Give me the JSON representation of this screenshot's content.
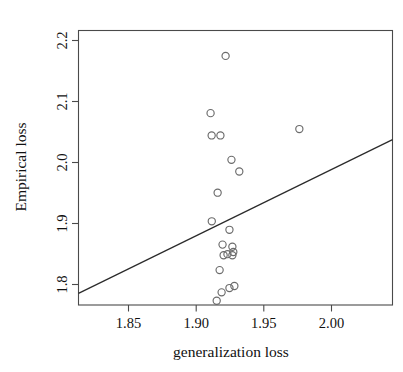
{
  "chart_data": {
    "type": "scatter",
    "title": "",
    "xlabel": "generalization loss",
    "ylabel": "Empirical loss",
    "xlim": [
      1.8095,
      2.0458
    ],
    "ylim": [
      1.7935,
      2.218
    ],
    "xticks": [
      1.85,
      1.9,
      1.95,
      2.0
    ],
    "xtick_labels": [
      "1.85",
      "1.90",
      "1.95",
      "2.00"
    ],
    "yticks": [
      1.8,
      1.9,
      2.0,
      2.1,
      2.2
    ],
    "ytick_labels": [
      "1.8",
      "1.9",
      "2.0",
      "2.1",
      "2.2"
    ],
    "grid": false,
    "legend": null,
    "marker": "open-circle",
    "marker_color": "#6b6b6b",
    "points": [
      {
        "x": 1.9202,
        "y": 2.1787
      },
      {
        "x": 1.9089,
        "y": 2.0902
      },
      {
        "x": 1.9097,
        "y": 2.0557
      },
      {
        "x": 1.9163,
        "y": 2.0557
      },
      {
        "x": 1.9757,
        "y": 2.0656
      },
      {
        "x": 1.9246,
        "y": 2.018
      },
      {
        "x": 1.9305,
        "y": 2.0
      },
      {
        "x": 1.9142,
        "y": 1.9672
      },
      {
        "x": 1.9098,
        "y": 1.9229
      },
      {
        "x": 1.9231,
        "y": 1.9098
      },
      {
        "x": 1.9179,
        "y": 1.8869
      },
      {
        "x": 1.9253,
        "y": 1.8836
      },
      {
        "x": 1.9187,
        "y": 1.8705
      },
      {
        "x": 1.9216,
        "y": 1.8721
      },
      {
        "x": 1.9253,
        "y": 1.8705
      },
      {
        "x": 1.926,
        "y": 1.8754
      },
      {
        "x": 1.9157,
        "y": 1.8475
      },
      {
        "x": 1.9231,
        "y": 1.8197
      },
      {
        "x": 1.9268,
        "y": 1.8229
      },
      {
        "x": 1.9172,
        "y": 1.8131
      },
      {
        "x": 1.9135,
        "y": 1.8
      }
    ],
    "fit_line": {
      "type": "linear-fit",
      "x0": 1.8095,
      "y0": 1.8115,
      "x1": 2.0458,
      "y1": 2.0492
    }
  }
}
